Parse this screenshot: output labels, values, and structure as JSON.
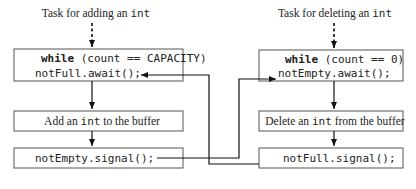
{
  "left_task": {
    "title_prefix": "Task for adding an ",
    "title_code": "int",
    "loop_keyword": "while",
    "loop_condition": " (count == CAPACITY)",
    "await_stmt": "notFull.await();",
    "action_prefix": "Add an ",
    "action_code": "int",
    "action_suffix": " to the buffer",
    "signal_stmt": "notEmpty.signal();"
  },
  "right_task": {
    "title_prefix": "Task for deleting an ",
    "title_code": "int",
    "loop_keyword": "while",
    "loop_condition_a": " (count == ",
    "loop_condition_zero": "0",
    "loop_condition_b": ")",
    "await_stmt": "notEmpty.await();",
    "action_prefix": "Delete an ",
    "action_code": "int",
    "action_suffix": " from the buffer",
    "signal_stmt": "notFull.signal();"
  },
  "colors": {
    "zero_literal": "#c8c8c8"
  }
}
